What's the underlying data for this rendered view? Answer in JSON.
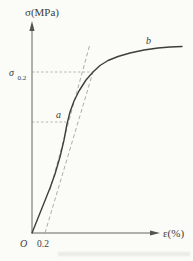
{
  "figure": {
    "labels": {
      "y_axis": "σ(MPa)",
      "x_axis": "ε(%)",
      "origin": "O",
      "offset_tick": "0.2",
      "sigma_offset_main": "σ",
      "sigma_offset_sub": "0.2",
      "point_a": "a",
      "point_b": "b"
    },
    "colors": {
      "background": "#fbfbf8",
      "axis": "#55534e",
      "curve": "#403e3a",
      "dashed": "#9a9892",
      "text": "#3d3b37",
      "artifact": "#dddcd5"
    }
  },
  "chart_data": {
    "type": "line",
    "xlabel": "ε(%)",
    "ylabel": "σ(MPa)",
    "x_ticks": [
      "0.2"
    ],
    "y_ticks": [],
    "legend": "none",
    "grid": false,
    "axis_style": "schematic, arrows on both axes, origin O",
    "annotations": [
      {
        "label": "σ0.2",
        "desc": "offset yield stress level marked on σ axis; dashed horizontal line to intersection of offset line with curve"
      },
      {
        "label": "a",
        "desc": "point on curve at end of proportional (linear elastic) region, marked by dashed level line"
      },
      {
        "label": "b",
        "desc": "upper end of curve where it flattens"
      },
      {
        "label": "O",
        "desc": "origin"
      },
      {
        "label": "0.2",
        "desc": "strain offset (%) on ε axis where dashed offset line starts"
      }
    ],
    "series": [
      {
        "name": "stress-strain-curve",
        "style": "solid",
        "points_px": [
          [
            32,
            233
          ],
          [
            38,
            218
          ],
          [
            44,
            203
          ],
          [
            50,
            188
          ],
          [
            55,
            174
          ],
          [
            60,
            157
          ],
          [
            64,
            140
          ],
          [
            67,
            124
          ],
          [
            70,
            112
          ],
          [
            74,
            101
          ],
          [
            79,
            91
          ],
          [
            86,
            80
          ],
          [
            93,
            72
          ],
          [
            100,
            65.5
          ],
          [
            108,
            60.5
          ],
          [
            118,
            56.5
          ],
          [
            130,
            53
          ],
          [
            144,
            50
          ],
          [
            158,
            48
          ],
          [
            170,
            47
          ],
          [
            182,
            46.5
          ]
        ],
        "points_data_strain_percent_vs_relative_stress": [
          [
            0,
            0
          ],
          [
            0.28,
            22
          ],
          [
            0.54,
            55
          ],
          [
            0.94,
            79
          ],
          [
            1.51,
            88
          ],
          [
            2.31,
            92
          ]
        ]
      },
      {
        "name": "elastic-line-extension",
        "style": "dashed",
        "points_px": [
          [
            50,
            190
          ],
          [
            90,
            44
          ]
        ]
      },
      {
        "name": "offset-line-0.2-percent",
        "style": "dashed",
        "points_px": [
          [
            45,
            233
          ],
          [
            93,
            72
          ]
        ]
      },
      {
        "name": "sigma02-level-line",
        "style": "dashed",
        "points_px": [
          [
            32,
            72
          ],
          [
            93,
            72
          ]
        ]
      },
      {
        "name": "a-level-line",
        "style": "dashed",
        "points_px": [
          [
            32,
            122
          ],
          [
            66,
            122
          ]
        ]
      }
    ]
  }
}
